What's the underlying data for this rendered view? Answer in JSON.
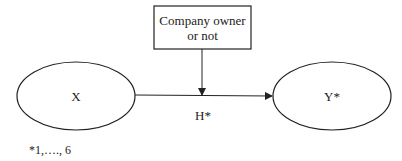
{
  "diagram": {
    "moderator": {
      "line1": "Company owner",
      "line2": "or not"
    },
    "nodes": {
      "x": {
        "label": "X"
      },
      "y": {
        "label": "Y*"
      }
    },
    "path_label": "H*",
    "footnote": "*1,…., 6"
  },
  "colors": {
    "stroke": "#222222",
    "background": "#ffffff"
  }
}
